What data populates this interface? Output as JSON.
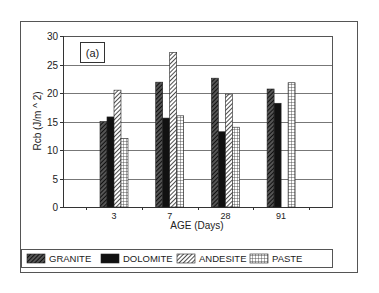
{
  "chart_data": {
    "type": "bar",
    "panel_label": "(a)",
    "title": "",
    "xlabel": "AGE (Days)",
    "ylabel": "Rcb (J/m ^ 2)",
    "categories": [
      "3",
      "7",
      "28",
      "91"
    ],
    "ylim": [
      0,
      30
    ],
    "yticks": [
      0,
      5,
      10,
      15,
      20,
      25,
      30
    ],
    "ytick_labels": [
      "0",
      "5",
      "10",
      "15",
      "20",
      "25",
      "30"
    ],
    "grid": "horizontal",
    "legend_position": "bottom",
    "series": [
      {
        "name": "GRANITE",
        "pattern": "dense-diagonal-dark",
        "values": [
          15.0,
          21.9,
          22.6,
          20.7
        ]
      },
      {
        "name": "DOLOMITE",
        "pattern": "solid-black",
        "values": [
          15.8,
          15.6,
          13.2,
          18.2
        ]
      },
      {
        "name": "ANDESITE",
        "pattern": "diagonal-light",
        "values": [
          20.5,
          27.1,
          19.8,
          null
        ]
      },
      {
        "name": "PASTE",
        "pattern": "grid",
        "values": [
          12.0,
          16.0,
          14.0,
          21.8
        ]
      }
    ]
  },
  "colors": {
    "ink": "#222222",
    "frame": "#555555",
    "grid": "#777777",
    "background": "#ffffff"
  }
}
